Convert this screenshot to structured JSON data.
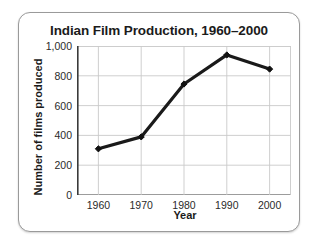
{
  "card": {
    "title": "Indian Film Production, 1960–2000"
  },
  "chart_data": {
    "type": "line",
    "title": "Indian Film Production, 1960–2000",
    "xlabel": "Year",
    "ylabel": "Number of films produced",
    "categories": [
      "1960",
      "1970",
      "1980",
      "1990",
      "2000"
    ],
    "x": [
      1960,
      1970,
      1980,
      1990,
      2000
    ],
    "values": [
      310,
      390,
      745,
      940,
      845
    ],
    "series": [
      {
        "name": "Number of films produced",
        "values": [
          310,
          390,
          745,
          940,
          845
        ]
      }
    ],
    "xlim": [
      1955,
      2005
    ],
    "ylim": [
      0,
      1000
    ],
    "yticks": [
      0,
      200,
      400,
      600,
      800,
      1000
    ],
    "ytick_labels": [
      "0",
      "200",
      "400",
      "600",
      "800",
      "1,000"
    ],
    "xticks": [
      1960,
      1970,
      1980,
      1990,
      2000
    ],
    "xtick_labels": [
      "1960",
      "1970",
      "1980",
      "1990",
      "2000"
    ],
    "grid": true,
    "legend": false,
    "legend_position": "none",
    "line_color": "#1a1a1a",
    "marker": "diamond",
    "marker_color": "#111111",
    "grid_color": "#c9c9c9",
    "axis_color": "#3a3a3a",
    "background_color": "#ffffff"
  }
}
